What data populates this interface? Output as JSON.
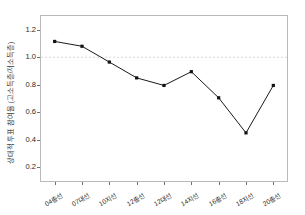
{
  "chart_data": {
    "type": "line",
    "title": "",
    "xlabel": "",
    "ylabel": "상대적 투표 참여율 (고소득층/저소득층)",
    "categories": [
      "04총선",
      "07대선",
      "10지선",
      "12총선",
      "12대선",
      "14지선",
      "16총선",
      "18지선",
      "20총선"
    ],
    "values": [
      1.115,
      1.08,
      0.965,
      0.85,
      0.795,
      0.895,
      0.705,
      0.45,
      0.795
    ],
    "series": [
      {
        "name": "상대적 투표 참여율",
        "values": [
          1.115,
          1.08,
          0.965,
          0.85,
          0.795,
          0.895,
          0.705,
          0.45,
          0.795
        ]
      }
    ],
    "yticks": [
      "0.2",
      "0.4",
      "0.6",
      "0.8",
      "1.0",
      "1.2"
    ],
    "ytick_values": [
      0.2,
      0.4,
      0.6,
      0.8,
      1.0,
      1.2
    ],
    "ylim": [
      0.1,
      1.3
    ],
    "grid": false,
    "legend": "none",
    "reference_line": {
      "value": 1.0,
      "style": "dashed",
      "color": "#d9d9d9"
    },
    "colors": {
      "line": "#1a1a1a",
      "marker": "#111111",
      "frame": "#b9b9b9",
      "background": "#ffffff",
      "text": "#2b2b2b"
    }
  }
}
